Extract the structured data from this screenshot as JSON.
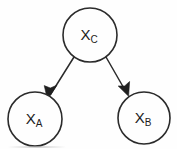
{
  "figure": {
    "kind": "causal-graph",
    "background_color": "#fefefe",
    "stroke_color": "#2b2b2b",
    "label_color": "#1c1c1c"
  },
  "nodes": [
    {
      "id": "XC",
      "name": "node-xc",
      "base": "X",
      "subscript": "C",
      "full_label": "XC",
      "cx": 90,
      "cy": 35,
      "r": 27,
      "role": "common-cause-parent"
    },
    {
      "id": "XA",
      "name": "node-xa",
      "base": "X",
      "subscript": "A",
      "full_label": "XA",
      "cx": 35,
      "cy": 119,
      "r": 27,
      "role": "child-left"
    },
    {
      "id": "XB",
      "name": "node-xb",
      "base": "X",
      "subscript": "B",
      "full_label": "XB",
      "cx": 144,
      "cy": 118,
      "r": 26,
      "role": "child-right"
    }
  ],
  "edges": [
    {
      "id": "edge-xc-xa",
      "from": "XC",
      "to": "XA",
      "directed": true,
      "arrowhead": "filled",
      "x1": 74,
      "y1": 57,
      "x2": 48,
      "y2": 98
    },
    {
      "id": "edge-xc-xb",
      "from": "XC",
      "to": "XB",
      "directed": true,
      "arrowhead": "filled",
      "x1": 106,
      "y1": 57,
      "x2": 128,
      "y2": 95
    }
  ],
  "artifacts": {
    "bottom_scan_line": true
  }
}
